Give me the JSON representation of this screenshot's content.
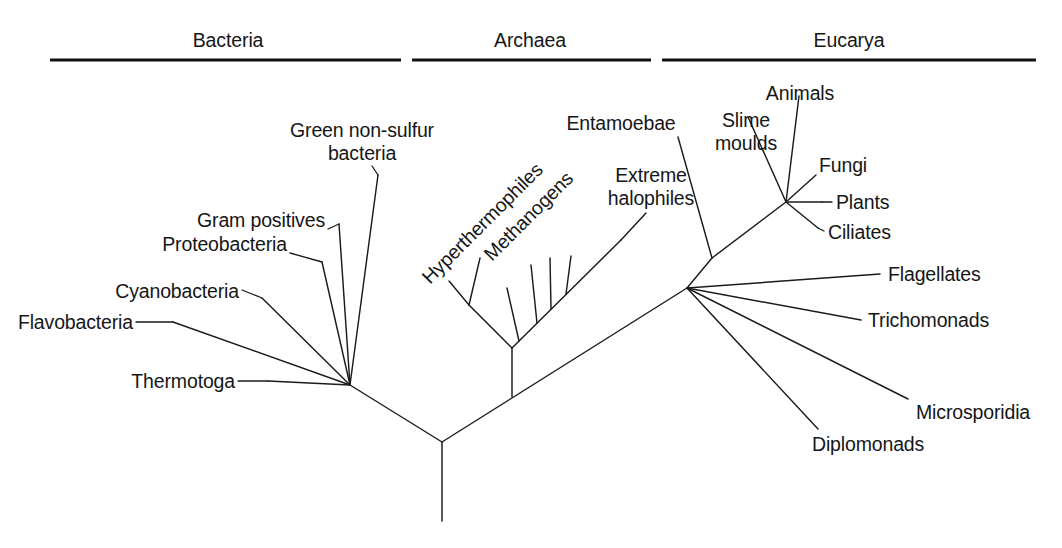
{
  "figure": {
    "width": 1062,
    "height": 548,
    "background_color": "#ffffff",
    "line_color": "#1b1b1b",
    "text_color": "#161616"
  },
  "domains": [
    {
      "name": "domain-bacteria",
      "label": "Bacteria",
      "label_x": 228,
      "label_y": 47,
      "rule_x1": 50,
      "rule_x2": 401,
      "rule_y": 60
    },
    {
      "name": "domain-archaea",
      "label": "Archaea",
      "label_x": 530,
      "label_y": 47,
      "rule_x1": 412,
      "rule_x2": 651,
      "rule_y": 60
    },
    {
      "name": "domain-eucarya",
      "label": "Eucarya",
      "label_x": 849,
      "label_y": 47,
      "rule_x1": 662,
      "rule_x2": 1036,
      "rule_y": 60
    }
  ],
  "branches": [
    {
      "name": "root-trunk",
      "points": "442,442 442,521"
    },
    {
      "name": "root-to-bacteria-node",
      "points": "442,442 350,385"
    },
    {
      "name": "root-to-eucarya-node",
      "points": "442,442 687,288"
    },
    {
      "name": "bacteria-node-to-flavobacteria",
      "points": "350,385 173,322"
    },
    {
      "name": "bacteria-node-to-cyanobacteria",
      "points": "350,385 262,298"
    },
    {
      "name": "bacteria-node-to-proteobacteria",
      "points": "350,385 322,262"
    },
    {
      "name": "bacteria-node-to-gram-positives",
      "points": "350,385 339,224"
    },
    {
      "name": "bacteria-node-to-green-non-sulfur",
      "points": "350,385 378,175"
    },
    {
      "name": "bacteria-node-to-thermotoga",
      "points": "350,385 268,381"
    },
    {
      "name": "archaea-stem",
      "points": "512,397 512,348"
    },
    {
      "name": "archaea-node-to-hyperthermophile-base",
      "points": "512,348 469,305"
    },
    {
      "name": "hyperthermophile-branch-a",
      "points": "469,305 449,281"
    },
    {
      "name": "hyperthermophile-branch-b",
      "points": "469,305 480,258"
    },
    {
      "name": "archaea-backbone",
      "points": "512,348 621,240"
    },
    {
      "name": "methanogen-branch-a",
      "points": "519,341 507,288"
    },
    {
      "name": "methanogen-branch-b",
      "points": "537,323 531,265"
    },
    {
      "name": "methanogen-branch-c",
      "points": "551,309 550,258"
    },
    {
      "name": "methanogen-branch-d",
      "points": "566,294 571,256"
    },
    {
      "name": "extreme-halophiles-branch",
      "points": "621,240 646,213"
    },
    {
      "name": "eucarya-node-to-diplomonads",
      "points": "687,288 818,429"
    },
    {
      "name": "eucarya-node-to-microsporidia",
      "points": "687,288 908,399"
    },
    {
      "name": "eucarya-node-to-trichomonads",
      "points": "687,288 861,320"
    },
    {
      "name": "eucarya-node-to-flagellates",
      "points": "687,288 880,274"
    },
    {
      "name": "eucarya-node-to-inner",
      "points": "687,288 712,258"
    },
    {
      "name": "inner-node-to-entamoebae",
      "points": "712,258 678,137"
    },
    {
      "name": "inner-node-to-crown",
      "points": "712,258 786,202"
    },
    {
      "name": "crown-node-to-slime-moulds",
      "points": "786,202 748,117"
    },
    {
      "name": "crown-node-to-animals",
      "points": "786,202 799,96"
    },
    {
      "name": "crown-node-to-fungi",
      "points": "786,202 816,175"
    },
    {
      "name": "crown-node-to-plants",
      "points": "786,202 822,202"
    },
    {
      "name": "crown-node-to-ciliates",
      "points": "786,202 818,228"
    }
  ],
  "leaders": [
    {
      "name": "leader-flavobacteria",
      "points": "136,322 173,322"
    },
    {
      "name": "leader-cyanobacteria",
      "points": "242,290 262,298"
    },
    {
      "name": "leader-proteobacteria",
      "points": "290,253 322,262"
    },
    {
      "name": "leader-gram-positives",
      "points": "328,229 339,224"
    },
    {
      "name": "leader-green-non-sulfur",
      "points": "372,166 378,175"
    },
    {
      "name": "leader-thermotoga",
      "points": "238,381 268,381"
    },
    {
      "name": "leader-entamoebae",
      "points": "678,137 678,137"
    },
    {
      "name": "leader-slime-moulds",
      "points": "748,117 748,117"
    },
    {
      "name": "leader-animals",
      "points": "799,96 799,96"
    },
    {
      "name": "leader-plants",
      "points": "822,202 832,202"
    },
    {
      "name": "leader-ciliates",
      "points": "818,228 824,231"
    }
  ],
  "taxa": [
    {
      "name": "taxon-green-non-sulfur-bacteria",
      "lines": [
        "Green non-sulfur",
        "bacteria"
      ],
      "x": 362,
      "y": 137,
      "anchor": "middle",
      "line_height": 23,
      "rotate": 0
    },
    {
      "name": "taxon-gram-positives",
      "lines": [
        "Gram positives"
      ],
      "x": 325,
      "y": 227,
      "anchor": "end",
      "line_height": 23,
      "rotate": 0
    },
    {
      "name": "taxon-proteobacteria",
      "lines": [
        "Proteobacteria"
      ],
      "x": 287,
      "y": 251,
      "anchor": "end",
      "line_height": 23,
      "rotate": 0
    },
    {
      "name": "taxon-cyanobacteria",
      "lines": [
        "Cyanobacteria"
      ],
      "x": 239,
      "y": 298,
      "anchor": "end",
      "line_height": 23,
      "rotate": 0
    },
    {
      "name": "taxon-flavobacteria",
      "lines": [
        "Flavobacteria"
      ],
      "x": 133,
      "y": 329,
      "anchor": "end",
      "line_height": 23,
      "rotate": 0
    },
    {
      "name": "taxon-thermotoga",
      "lines": [
        "Thermotoga"
      ],
      "x": 235,
      "y": 388,
      "anchor": "end",
      "line_height": 23,
      "rotate": 0
    },
    {
      "name": "taxon-hyperthermophiles",
      "lines": [
        "Hyperthermophiles"
      ],
      "x": 430,
      "y": 285,
      "anchor": "start",
      "line_height": 23,
      "rotate": -45
    },
    {
      "name": "taxon-methanogens",
      "lines": [
        "Methanogens"
      ],
      "x": 492,
      "y": 262,
      "anchor": "start",
      "line_height": 23,
      "rotate": -45
    },
    {
      "name": "taxon-extreme-halophiles",
      "lines": [
        "Extreme",
        "halophiles"
      ],
      "x": 651,
      "y": 182,
      "anchor": "middle",
      "line_height": 23,
      "rotate": 0
    },
    {
      "name": "taxon-entamoebae",
      "lines": [
        "Entamoebae"
      ],
      "x": 621,
      "y": 130,
      "anchor": "middle",
      "line_height": 23,
      "rotate": 0
    },
    {
      "name": "taxon-slime-moulds",
      "lines": [
        "Slime",
        "moulds"
      ],
      "x": 746,
      "y": 127,
      "anchor": "middle",
      "line_height": 23,
      "rotate": 0
    },
    {
      "name": "taxon-animals",
      "lines": [
        "Animals"
      ],
      "x": 800,
      "y": 100,
      "anchor": "middle",
      "line_height": 23,
      "rotate": 0
    },
    {
      "name": "taxon-fungi",
      "lines": [
        "Fungi"
      ],
      "x": 819,
      "y": 172,
      "anchor": "start",
      "line_height": 23,
      "rotate": 0
    },
    {
      "name": "taxon-plants",
      "lines": [
        "Plants"
      ],
      "x": 836,
      "y": 209,
      "anchor": "start",
      "line_height": 23,
      "rotate": 0
    },
    {
      "name": "taxon-ciliates",
      "lines": [
        "Ciliates"
      ],
      "x": 828,
      "y": 239,
      "anchor": "start",
      "line_height": 23,
      "rotate": 0
    },
    {
      "name": "taxon-flagellates",
      "lines": [
        "Flagellates"
      ],
      "x": 888,
      "y": 281,
      "anchor": "start",
      "line_height": 23,
      "rotate": 0
    },
    {
      "name": "taxon-trichomonads",
      "lines": [
        "Trichomonads"
      ],
      "x": 868,
      "y": 327,
      "anchor": "start",
      "line_height": 23,
      "rotate": 0
    },
    {
      "name": "taxon-microsporidia",
      "lines": [
        "Microsporidia"
      ],
      "x": 916,
      "y": 419,
      "anchor": "start",
      "line_height": 23,
      "rotate": 0
    },
    {
      "name": "taxon-diplomonads",
      "lines": [
        "Diplomonads"
      ],
      "x": 812,
      "y": 451,
      "anchor": "start",
      "line_height": 23,
      "rotate": 0
    }
  ]
}
